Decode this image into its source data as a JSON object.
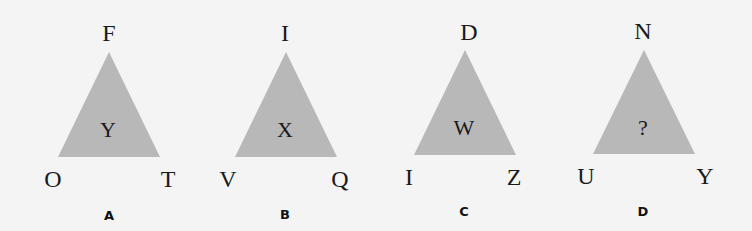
{
  "colors": {
    "background": "#f4f4f4",
    "triangle_fill": "#b8b8b8",
    "text": "#1a1a1a"
  },
  "figures": [
    {
      "label": "A",
      "top": "F",
      "center": "Y",
      "bottom_left": "O",
      "bottom_right": "T"
    },
    {
      "label": "B",
      "top": "I",
      "center": "X",
      "bottom_left": "V",
      "bottom_right": "Q"
    },
    {
      "label": "C",
      "top": "D",
      "center": "W",
      "bottom_left": "I",
      "bottom_right": "Z"
    },
    {
      "label": "D",
      "top": "N",
      "center": "?",
      "bottom_left": "U",
      "bottom_right": "Y"
    }
  ]
}
